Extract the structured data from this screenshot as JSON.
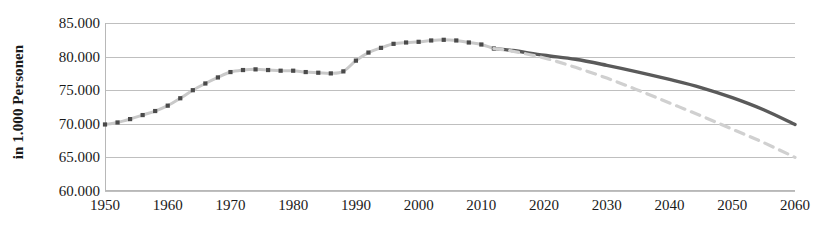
{
  "chart_data": {
    "type": "line",
    "title": "",
    "xlabel": "",
    "ylabel": "in 1.000 Personen",
    "xlim": [
      1950,
      2060
    ],
    "ylim": [
      60000,
      85000
    ],
    "grid": true,
    "legend_position": "none",
    "y_ticks": [
      "85.000",
      "80.000",
      "75.000",
      "70.000",
      "65.000",
      "60.000"
    ],
    "y_tick_values": [
      85000,
      80000,
      75000,
      70000,
      65000,
      60000
    ],
    "x_ticks": [
      "1950",
      "1960",
      "1970",
      "1980",
      "1990",
      "2000",
      "2010",
      "2020",
      "2030",
      "2040",
      "2050",
      "2060"
    ],
    "x_tick_values": [
      1950,
      1960,
      1970,
      1980,
      1990,
      2000,
      2010,
      2020,
      2030,
      2040,
      2050,
      2060
    ],
    "colors": {
      "historical_line": "#c9c9c9",
      "historical_marker": "#4a4a4a",
      "projection_upper": "#5a5a5a",
      "projection_lower": "#d0d0d0",
      "gridline": "#bfbfbf",
      "axis": "#b8b8b8",
      "text": "#1a1a1a",
      "background": "#ffffff"
    },
    "series": [
      {
        "name": "Bevoelkerung Ist-Entwicklung",
        "style": "dotted-with-square-markers",
        "x": [
          1950,
          1952,
          1954,
          1956,
          1958,
          1960,
          1962,
          1964,
          1966,
          1968,
          1970,
          1972,
          1974,
          1976,
          1978,
          1980,
          1982,
          1984,
          1986,
          1988,
          1990,
          1992,
          1994,
          1996,
          1998,
          2000,
          2002,
          2004,
          2006,
          2008,
          2010,
          2012
        ],
        "values": [
          69900,
          70200,
          70700,
          71300,
          71900,
          72700,
          73800,
          75000,
          76000,
          76900,
          77700,
          78000,
          78100,
          78000,
          77900,
          77900,
          77700,
          77600,
          77500,
          77800,
          79400,
          80600,
          81300,
          81900,
          82100,
          82200,
          82400,
          82500,
          82400,
          82100,
          81800,
          81200
        ]
      },
      {
        "name": "Vorausberechnung Obergrenze",
        "style": "solid",
        "x": [
          2012,
          2015,
          2020,
          2025,
          2030,
          2035,
          2040,
          2045,
          2050,
          2055,
          2060
        ],
        "values": [
          81200,
          80900,
          80200,
          79600,
          78700,
          77700,
          76600,
          75400,
          73900,
          72100,
          69900
        ]
      },
      {
        "name": "Vorausberechnung Untergrenze",
        "style": "dashed",
        "x": [
          2012,
          2015,
          2020,
          2025,
          2030,
          2035,
          2040,
          2045,
          2050,
          2055,
          2060
        ],
        "values": [
          81200,
          80800,
          79800,
          78400,
          76800,
          75000,
          73100,
          71200,
          69200,
          67200,
          65000
        ]
      }
    ]
  }
}
